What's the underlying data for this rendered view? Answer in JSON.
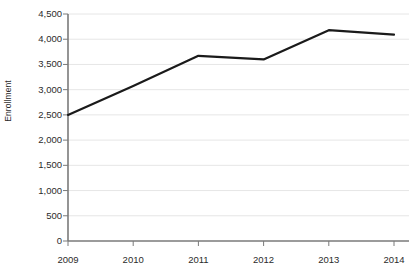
{
  "chart_data": {
    "type": "line",
    "title": "",
    "xlabel": "",
    "ylabel": "Enrollment",
    "categories": [
      "2009",
      "2010",
      "2011",
      "2012",
      "2013",
      "2014"
    ],
    "values": [
      2500,
      3075,
      3670,
      3600,
      4180,
      4090
    ],
    "series": [
      {
        "name": "Enrollment",
        "values": [
          2500,
          3075,
          3670,
          3600,
          4180,
          4090
        ],
        "color": "#1a1a1a"
      }
    ],
    "ylim": [
      0,
      4500
    ],
    "ytick_labels": [
      "4,500",
      "4,000",
      "3,500",
      "3,000",
      "2,500",
      "2,000",
      "1,500",
      "1,000",
      "500",
      "0"
    ],
    "ytick_values": [
      4500,
      4000,
      3500,
      3000,
      2500,
      2000,
      1500,
      1000,
      500,
      0
    ],
    "xtick_labels": [
      "2009",
      "2010",
      "2011",
      "2012",
      "2013",
      "2014"
    ],
    "grid": true,
    "grid_axis": "y",
    "grid_color": "#e6e6e6",
    "axis_color": "#7a7a7a",
    "legend": false,
    "legend_position": "none",
    "background": "#ffffff",
    "line_width": 2.2
  },
  "axes": {
    "y_title": "Enrollment"
  }
}
